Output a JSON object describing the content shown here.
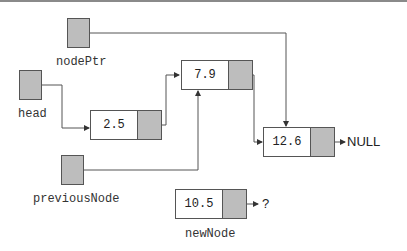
{
  "diagram": {
    "pointers": [
      {
        "id": "nodePtr",
        "label": "nodePtr",
        "points_to": "12.6"
      },
      {
        "id": "head",
        "label": "head",
        "points_to": "2.5"
      },
      {
        "id": "previousNode",
        "label": "previousNode",
        "points_to": "7.9"
      }
    ],
    "nodes": [
      {
        "id": "n1",
        "value": "2.5",
        "next": "7.9"
      },
      {
        "id": "n2",
        "value": "7.9",
        "next": "12.6"
      },
      {
        "id": "n3",
        "value": "12.6",
        "next": "NULL"
      }
    ],
    "new_node": {
      "label": "newNode",
      "value": "10.5",
      "next": "?"
    },
    "terminals": {
      "null_label": "NULL",
      "unknown_label": "?"
    },
    "colors": {
      "pointer_fill": "#bdbdbd",
      "border": "#555555",
      "line": "#555555"
    }
  }
}
